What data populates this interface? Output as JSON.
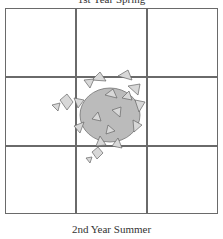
{
  "labels": {
    "top_caption": "1st Year Spring",
    "bottom_caption": "2nd Year Summer"
  },
  "grid": {
    "rows": 3,
    "cols": 3,
    "line_color": "#6a6a6a"
  },
  "plant": {
    "icon": "plant-cluster-icon",
    "color": "#777777"
  }
}
